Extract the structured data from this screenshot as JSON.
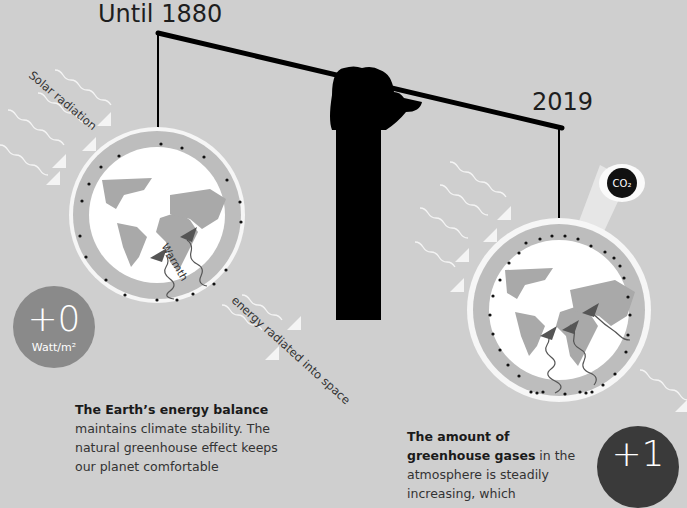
{
  "left_panel": {
    "year_label": "Until 1880",
    "solar_label": "Solar radiation",
    "warmth_label": "Warmth",
    "space_label": "energy radiated into space",
    "badge_value": "+0",
    "badge_unit": "Watt/m²",
    "badge_color": "#8a8a8a",
    "text_bold": "The Earth’s energy balance",
    "text_body": " maintains climate stability. The natural greenhouse effect keeps our planet comfortable"
  },
  "right_panel": {
    "year_label": "2019",
    "co2_label": "CO₂",
    "badge_value": "+1",
    "badge_color": "#3a3a3a",
    "text_bold": "The amount of greenhouse gases",
    "text_body": " in the atmosphere is steadily increasing, which"
  },
  "colors": {
    "background": "#cfcfcf",
    "land": "#a9a9a9",
    "atmosphere_ring": "#bdbdbd",
    "arm": "#000000"
  }
}
